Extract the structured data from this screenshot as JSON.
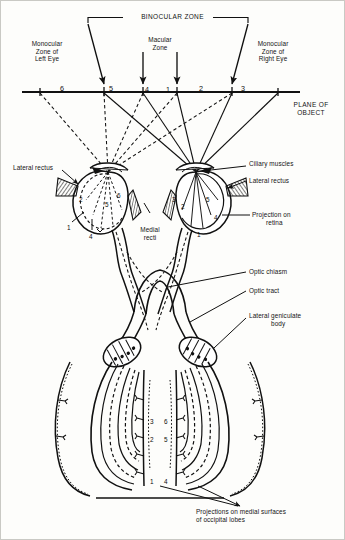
{
  "figure": {
    "title": "BINOCULAR ZONE",
    "plane_label_line1": "PLANE OF",
    "plane_label_line2": "OBJECT",
    "macular_zone_line1": "Macular",
    "macular_zone_line2": "Zone",
    "monocular_left": {
      "line1": "Monocular",
      "line2": "Zone of",
      "line3": "Left Eye"
    },
    "monocular_right": {
      "line1": "Monocular",
      "line2": "Zone of",
      "line3": "Right Eye"
    }
  },
  "plane_numbers": [
    {
      "value": "6",
      "x": 60,
      "y": 84
    },
    {
      "value": "5",
      "x": 109,
      "y": 84
    },
    {
      "value": "4",
      "x": 145,
      "y": 85
    },
    {
      "value": "1",
      "x": 166,
      "y": 85
    },
    {
      "value": "2",
      "x": 199,
      "y": 84
    },
    {
      "value": "3",
      "x": 241,
      "y": 84
    }
  ],
  "labels": {
    "lateral_rectus_left": "Lateral rectus",
    "lateral_rectus_right": "Lateral rectus",
    "ciliary_muscles": "Ciliary muscles",
    "medial_recti_line1": "Medial",
    "medial_recti_line2": "recti",
    "projection_on_retina_line1": "Projection on",
    "projection_on_retina_line2": "retina",
    "optic_chiasm": "Optic chiasm",
    "optic_tract": "Optic tract",
    "lateral_geniculate_line1": "Lateral geniculate",
    "lateral_geniculate_line2": "body",
    "occipital_caption_line1": "Projections on medial surfaces",
    "occipital_caption_line2": "of occipital lobes"
  },
  "retina_numbers_left_eye": [
    {
      "value": "2",
      "x": 79,
      "y": 196
    },
    {
      "value": "6",
      "x": 117,
      "y": 192
    },
    {
      "value": "5",
      "x": 105,
      "y": 201
    },
    {
      "value": "1",
      "x": 67,
      "y": 224
    },
    {
      "value": "4",
      "x": 89,
      "y": 233
    }
  ],
  "retina_numbers_right_eye": [
    {
      "value": "3",
      "x": 172,
      "y": 196
    },
    {
      "value": "2",
      "x": 181,
      "y": 203
    },
    {
      "value": "5",
      "x": 206,
      "y": 196
    },
    {
      "value": "1",
      "x": 197,
      "y": 231
    }
  ],
  "projection_marker": {
    "value": "4",
    "x": 214,
    "y": 214
  },
  "occipital_number_pairs": [
    {
      "left": "3",
      "right": "6",
      "y": 418
    },
    {
      "left": "2",
      "right": "5",
      "y": 436
    },
    {
      "left": "1",
      "right": "4",
      "y": 478
    }
  ],
  "colors": {
    "ink": "#111111",
    "paper": "#fdfdfb",
    "hatch": "#1a1a1a"
  }
}
